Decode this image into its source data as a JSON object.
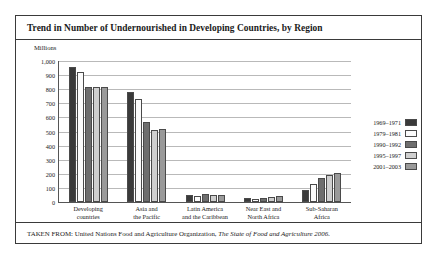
{
  "figure": {
    "title": "Trend in Number of Undernourished in Developing Countries, by Region",
    "unit_label": "Millions",
    "source_prefix": "TAKEN FROM: United Nations Food and Agriculture Organization, ",
    "source_italic": "The State of Food and Agriculture 2006."
  },
  "chart_data": {
    "type": "bar",
    "title": "Trend in Number of Undernourished in Developing Countries, by Region",
    "xlabel": "",
    "ylabel": "Millions",
    "ylim": [
      0,
      1000
    ],
    "ytick_labels": [
      "1,000",
      "900",
      "800",
      "700",
      "600",
      "500",
      "400",
      "300",
      "200",
      "100",
      "0"
    ],
    "ytick_values": [
      1000,
      900,
      800,
      700,
      600,
      500,
      400,
      300,
      200,
      100,
      0
    ],
    "grid": true,
    "legend_position": "right",
    "categories": [
      "Developing countries",
      "Asia and the Pacific",
      "Latin America and the Caribbean",
      "Near East and North Africa",
      "Sub-Saharan Africa"
    ],
    "category_lines": [
      [
        "Developing",
        "countries"
      ],
      [
        "Asia and",
        "the Pacific"
      ],
      [
        "Latin America",
        "and the Caribbean"
      ],
      [
        "Near East and",
        "North Africa"
      ],
      [
        "Sub-Saharan",
        "Africa"
      ]
    ],
    "series": [
      {
        "name": "1969–1971",
        "color": "#3a3a3a",
        "values": [
          955,
          780,
          53,
          25,
          88
        ]
      },
      {
        "name": "1979–1981",
        "color": "#fbfbfb",
        "values": [
          920,
          730,
          45,
          18,
          125
        ]
      },
      {
        "name": "1990–1992",
        "color": "#6e6e6e",
        "values": [
          815,
          570,
          58,
          25,
          170
        ]
      },
      {
        "name": "1995–1997",
        "color": "#cfcfcf",
        "values": [
          815,
          510,
          52,
          38,
          195
        ]
      },
      {
        "name": "2001–2003",
        "color": "#9a9a9a",
        "values": [
          815,
          520,
          50,
          40,
          205
        ]
      }
    ]
  }
}
